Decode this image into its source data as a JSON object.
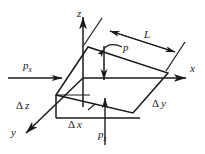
{
  "figure": {
    "type": "3d-control-volume-diagram",
    "background_color": "#ffffff",
    "stroke_color": "#1a1a1a",
    "axes": {
      "z_label": "z",
      "x_label": "x",
      "y_label": "y"
    },
    "dimensions": {
      "length_label": "L",
      "delta_x_symbol": "Δ",
      "delta_x_var": "x",
      "delta_y_symbol": "Δ",
      "delta_y_var": "y",
      "delta_z_symbol": "Δ",
      "delta_z_var": "z"
    },
    "pressures": {
      "p_label": "p",
      "px_base": "p",
      "px_sub": "x",
      "pz_base": "p",
      "pz_sub": "z"
    }
  }
}
